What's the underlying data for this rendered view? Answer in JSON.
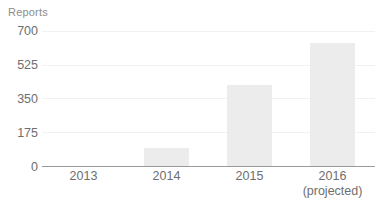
{
  "chart_data": {
    "type": "bar",
    "title": "",
    "subtitle": "",
    "xlabel": "",
    "ylabel": "Reports",
    "categories": [
      "2013",
      "2014",
      "2015",
      "2016"
    ],
    "category_sublabels": [
      "",
      "",
      "",
      "(projected)"
    ],
    "values": [
      0,
      95,
      420,
      640
    ],
    "ylim": [
      0,
      700
    ],
    "yticks": [
      0,
      175,
      350,
      525,
      700
    ],
    "ytick_labels": [
      "0",
      "175",
      "350",
      "525",
      "700"
    ],
    "grid": true,
    "grid_axis": "y",
    "legend": false,
    "legend_position": "none",
    "bar_color": "#ececec",
    "axis_color": "#9a9a9a",
    "grid_color": "#f1f1f1",
    "text_color": "#6e6e6e",
    "axis_title_color": "#8d8d8d",
    "background_color": "#ffffff"
  }
}
